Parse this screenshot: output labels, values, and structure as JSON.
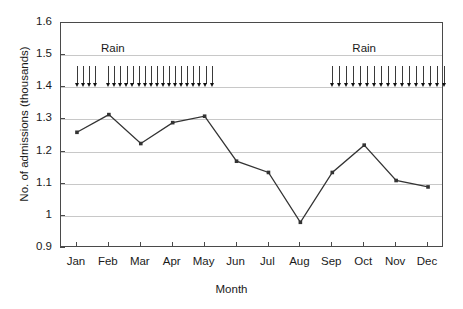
{
  "chart_data": {
    "type": "line",
    "title": "",
    "xlabel": "Month",
    "ylabel": "No. of admissions (thousands)",
    "categories": [
      "Jan",
      "Feb",
      "Mar",
      "Apr",
      "May",
      "Jun",
      "Jul",
      "Aug",
      "Sep",
      "Oct",
      "Nov",
      "Dec"
    ],
    "values": [
      1.26,
      1.315,
      1.225,
      1.29,
      1.31,
      1.17,
      1.135,
      0.98,
      1.135,
      1.22,
      1.11,
      1.09
    ],
    "series": [
      {
        "name": "No. of admissions",
        "values": [
          1.26,
          1.315,
          1.225,
          1.29,
          1.31,
          1.17,
          1.135,
          0.98,
          1.135,
          1.22,
          1.11,
          1.09
        ],
        "marker": "square",
        "color": "#333333"
      }
    ],
    "ylim": [
      0.9,
      1.6
    ],
    "yticks": [
      0.9,
      1.0,
      1.1,
      1.2,
      1.3,
      1.4,
      1.5,
      1.6
    ],
    "ytick_labels": [
      "0.9",
      "1",
      "1.1",
      "1.2",
      "1.3",
      "1.4",
      "1.5",
      "1.6"
    ],
    "xtick_labels": [
      "Jan",
      "Feb",
      "Mar",
      "Apr",
      "May",
      "Jun",
      "Jul",
      "Aug",
      "Sep",
      "Oct",
      "Nov",
      "Dec"
    ],
    "grid": true,
    "grid_axis": "y",
    "legend": "none",
    "annotations": [
      {
        "label": "Rain",
        "type": "arrow-group",
        "baseline_value": 1.4,
        "top_value": 1.465,
        "label_value": 1.52,
        "label_month": "Feb",
        "start_month": "Jan",
        "end_month": "May",
        "arrow_count": 22,
        "gap_after_index": 3
      },
      {
        "label": "Rain",
        "type": "arrow-group",
        "baseline_value": 1.4,
        "top_value": 1.465,
        "label_value": 1.52,
        "label_month": "Oct",
        "start_month": "Sep",
        "end_month": "Dec",
        "arrow_count": 17
      }
    ]
  },
  "axes": {
    "y_title": "No. of admissions (thousands)",
    "x_title": "Month"
  },
  "colors": {
    "line": "#333333",
    "grid": "#c8c8c8",
    "frame": "#4a4a4a",
    "text": "#1a1a1a",
    "rain_arrow": "#3a3a3a",
    "background": "#ffffff"
  }
}
